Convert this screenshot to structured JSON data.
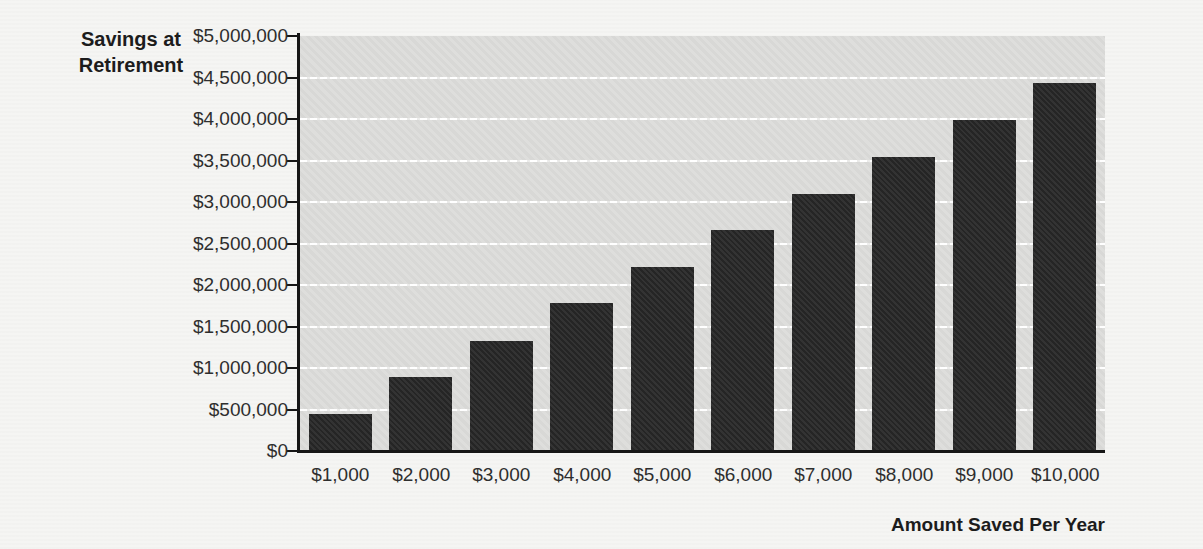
{
  "chart_data": {
    "type": "bar",
    "title": "",
    "ylabel": "Savings at Retirement",
    "xlabel": "Amount Saved Per Year",
    "categories": [
      "$1,000",
      "$2,000",
      "$3,000",
      "$4,000",
      "$5,000",
      "$6,000",
      "$7,000",
      "$8,000",
      "$9,000",
      "$10,000"
    ],
    "values": [
      440000,
      890000,
      1330000,
      1780000,
      2220000,
      2660000,
      3100000,
      3540000,
      3990000,
      4430000
    ],
    "y_ticks": [
      "$5,000,000",
      "$4,500,000",
      "$4,000,000",
      "$3,500,000",
      "$3,000,000",
      "$2,500,000",
      "$2,000,000",
      "$1,500,000",
      "$1,000,000",
      "$500,000",
      "$0"
    ],
    "ylim": [
      0,
      5000000
    ],
    "y_tick_interval": 500000,
    "grid": true,
    "legend": "none",
    "colors": {
      "bar": "#282828",
      "plot_background": "#dcdcda",
      "gridline": "#ffffff",
      "axis": "#161616",
      "text": "#2e2e2e",
      "page_background": "#f5f5f3"
    }
  }
}
